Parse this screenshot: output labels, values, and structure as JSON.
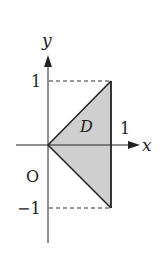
{
  "diagram": {
    "axes": {
      "x_label": "x",
      "y_label": "y",
      "origin_label": "O"
    },
    "ticks": {
      "x_one": "1",
      "y_one": "1",
      "y_minus_one": "−1"
    },
    "region": {
      "label": "D",
      "vertices": [
        [
          0,
          0
        ],
        [
          1,
          1
        ],
        [
          1,
          -1
        ]
      ],
      "fill": "#cfcfcf"
    },
    "colors": {
      "line": "#222222",
      "dash": "#333333"
    }
  }
}
